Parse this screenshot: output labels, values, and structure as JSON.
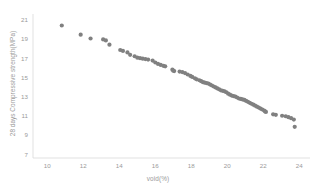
{
  "chart_data": {
    "type": "scatter",
    "title": "",
    "xlabel": "void(%)",
    "ylabel": "28 days Compressive strength(MPa)",
    "xlim": [
      9.2,
      24.6
    ],
    "ylim": [
      6.6,
      21.6
    ],
    "xticks": [
      10,
      12,
      14,
      16,
      18,
      20,
      22,
      24
    ],
    "yticks": [
      7,
      9,
      11,
      13,
      15,
      17,
      19,
      21
    ],
    "grid": false,
    "legend": null,
    "marker_color": "#808080",
    "axis_color": "#d9d9d9",
    "tick_text_color": "#9a9a9a",
    "marker_size": 2.1,
    "points": [
      [
        10.8,
        20.4
      ],
      [
        11.85,
        19.45
      ],
      [
        12.4,
        19.05
      ],
      [
        13.1,
        18.95
      ],
      [
        13.25,
        18.85
      ],
      [
        13.45,
        18.4
      ],
      [
        14.05,
        17.85
      ],
      [
        14.2,
        17.75
      ],
      [
        14.45,
        17.6
      ],
      [
        14.6,
        17.35
      ],
      [
        14.85,
        17.2
      ],
      [
        15.0,
        17.05
      ],
      [
        15.15,
        17.0
      ],
      [
        15.3,
        16.95
      ],
      [
        15.45,
        16.9
      ],
      [
        15.6,
        16.85
      ],
      [
        15.85,
        16.75
      ],
      [
        16.0,
        16.55
      ],
      [
        16.15,
        16.4
      ],
      [
        16.3,
        16.3
      ],
      [
        16.45,
        16.2
      ],
      [
        16.55,
        16.15
      ],
      [
        16.95,
        15.8
      ],
      [
        17.0,
        15.7
      ],
      [
        17.05,
        15.65
      ],
      [
        17.35,
        15.6
      ],
      [
        17.5,
        15.55
      ],
      [
        17.65,
        15.45
      ],
      [
        17.8,
        15.3
      ],
      [
        17.95,
        15.15
      ],
      [
        18.05,
        15.05
      ],
      [
        18.2,
        14.9
      ],
      [
        18.3,
        14.8
      ],
      [
        18.45,
        14.7
      ],
      [
        18.55,
        14.6
      ],
      [
        18.65,
        14.5
      ],
      [
        18.75,
        14.45
      ],
      [
        18.85,
        14.4
      ],
      [
        18.95,
        14.35
      ],
      [
        19.05,
        14.25
      ],
      [
        19.15,
        14.15
      ],
      [
        19.25,
        14.05
      ],
      [
        19.35,
        13.95
      ],
      [
        19.45,
        13.85
      ],
      [
        19.55,
        13.75
      ],
      [
        19.65,
        13.65
      ],
      [
        19.75,
        13.6
      ],
      [
        19.85,
        13.55
      ],
      [
        19.95,
        13.45
      ],
      [
        20.05,
        13.3
      ],
      [
        20.15,
        13.2
      ],
      [
        20.25,
        13.1
      ],
      [
        20.35,
        13.05
      ],
      [
        20.45,
        13.0
      ],
      [
        20.55,
        12.9
      ],
      [
        20.65,
        12.8
      ],
      [
        20.75,
        12.75
      ],
      [
        20.85,
        12.7
      ],
      [
        20.95,
        12.65
      ],
      [
        21.05,
        12.55
      ],
      [
        21.15,
        12.45
      ],
      [
        21.25,
        12.35
      ],
      [
        21.35,
        12.25
      ],
      [
        21.45,
        12.15
      ],
      [
        21.55,
        12.05
      ],
      [
        21.65,
        11.95
      ],
      [
        21.75,
        11.85
      ],
      [
        21.85,
        11.75
      ],
      [
        21.95,
        11.65
      ],
      [
        22.05,
        11.55
      ],
      [
        22.1,
        11.45
      ],
      [
        22.15,
        11.4
      ],
      [
        22.55,
        11.15
      ],
      [
        22.7,
        11.1
      ],
      [
        23.05,
        11.0
      ],
      [
        23.25,
        10.95
      ],
      [
        23.4,
        10.85
      ],
      [
        23.55,
        10.75
      ],
      [
        23.7,
        10.6
      ],
      [
        23.75,
        9.85
      ]
    ]
  }
}
